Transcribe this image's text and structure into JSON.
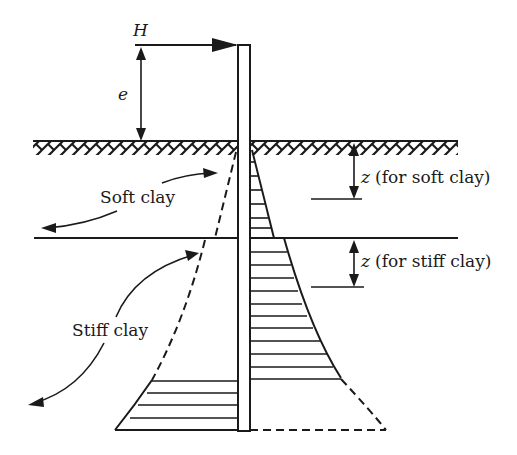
{
  "diagram": {
    "type": "laterally loaded pile soil reaction diagram",
    "labels": {
      "load": "H",
      "eccentricity": "e",
      "soft_layer": "Soft clay",
      "stiff_layer": "Stiff clay",
      "z_soft": "z",
      "z_soft_note": "(for soft clay)",
      "z_stiff": "z",
      "z_stiff_note": "(for stiff clay)"
    },
    "colors": {
      "ink": "#1a1a1a",
      "background": "#ffffff"
    }
  }
}
